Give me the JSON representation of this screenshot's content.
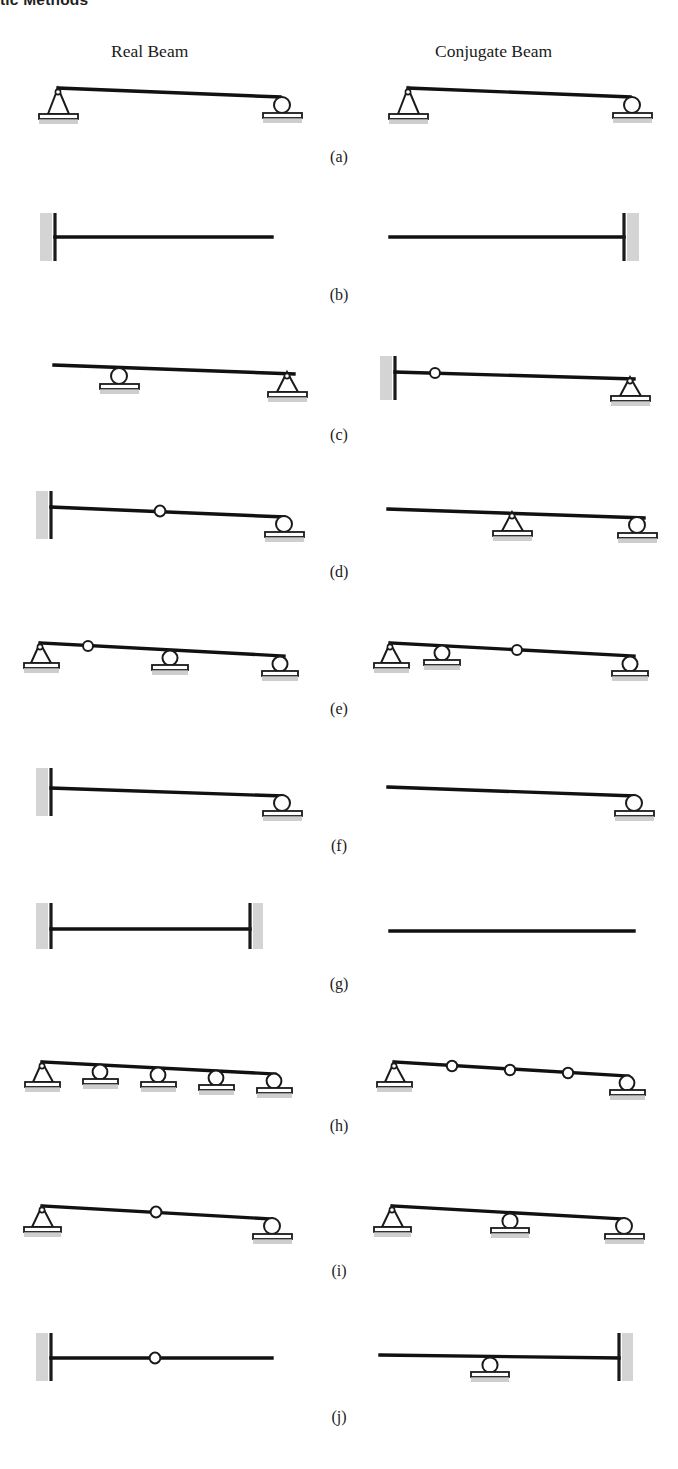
{
  "running_head": "tic Methods",
  "headings": {
    "real": "Real Beam",
    "conjugate": "Conjugate Beam"
  },
  "labels": {
    "a": "(a)",
    "b": "(b)",
    "c": "(c)",
    "d": "(d)",
    "e": "(e)",
    "f": "(f)",
    "g": "(g)",
    "h": "(h)",
    "i": "(i)",
    "j": "(j)"
  },
  "colors": {
    "beam": "#111111",
    "support_outline": "#1a1a1a",
    "hatch": "#9a9a9a",
    "text": "#1a1a1a",
    "page": "#ffffff"
  },
  "figure": {
    "type": "engineering-diagram",
    "columns": [
      "Real Beam",
      "Conjugate Beam"
    ],
    "rows": [
      {
        "label": "(a)",
        "real": {
          "description": "Simply supported beam: pin at left end, roller at right end",
          "supports": [
            {
              "type": "pin",
              "pos": "left-end"
            },
            {
              "type": "roller",
              "pos": "right-end"
            }
          ]
        },
        "conjugate": {
          "description": "Simply supported beam: pin at left end, roller at right end",
          "supports": [
            {
              "type": "pin",
              "pos": "left-end"
            },
            {
              "type": "roller",
              "pos": "right-end"
            }
          ]
        }
      },
      {
        "label": "(b)",
        "real": {
          "description": "Cantilever: fixed at left end, free at right end",
          "supports": [
            {
              "type": "fixed",
              "pos": "left-end"
            },
            {
              "type": "free",
              "pos": "right-end"
            }
          ]
        },
        "conjugate": {
          "description": "Cantilever reversed: free at left end, fixed at right end",
          "supports": [
            {
              "type": "free",
              "pos": "left-end"
            },
            {
              "type": "fixed",
              "pos": "right-end"
            }
          ]
        }
      },
      {
        "label": "(c)",
        "real": {
          "description": "Overhang: free left end, roller interior, pin at right end",
          "supports": [
            {
              "type": "free",
              "pos": "left-end"
            },
            {
              "type": "roller",
              "pos": "interior"
            },
            {
              "type": "pin",
              "pos": "right-end"
            }
          ]
        },
        "conjugate": {
          "description": "Fixed left end, internal hinge, pin at right end",
          "supports": [
            {
              "type": "fixed",
              "pos": "left-end"
            },
            {
              "type": "hinge",
              "pos": "interior"
            },
            {
              "type": "pin",
              "pos": "right-end"
            }
          ]
        }
      },
      {
        "label": "(d)",
        "real": {
          "description": "Fixed left end, internal hinge, roller at right end",
          "supports": [
            {
              "type": "fixed",
              "pos": "left-end"
            },
            {
              "type": "hinge",
              "pos": "interior"
            },
            {
              "type": "roller",
              "pos": "right-end"
            }
          ]
        },
        "conjugate": {
          "description": "Free left end, pin interior, roller at right end",
          "supports": [
            {
              "type": "free",
              "pos": "left-end"
            },
            {
              "type": "pin",
              "pos": "interior"
            },
            {
              "type": "roller",
              "pos": "right-end"
            }
          ]
        }
      },
      {
        "label": "(e)",
        "real": {
          "description": "Pin at left end, internal hinge, roller interior, roller at right end",
          "supports": [
            {
              "type": "pin",
              "pos": "left-end"
            },
            {
              "type": "hinge",
              "pos": "interior"
            },
            {
              "type": "roller",
              "pos": "interior"
            },
            {
              "type": "roller",
              "pos": "right-end"
            }
          ]
        },
        "conjugate": {
          "description": "Pin at left end, roller interior, internal hinge, roller at right end",
          "supports": [
            {
              "type": "pin",
              "pos": "left-end"
            },
            {
              "type": "roller",
              "pos": "interior"
            },
            {
              "type": "hinge",
              "pos": "interior"
            },
            {
              "type": "roller",
              "pos": "right-end"
            }
          ]
        }
      },
      {
        "label": "(f)",
        "real": {
          "description": "Propped cantilever: fixed at left end, roller at right end",
          "supports": [
            {
              "type": "fixed",
              "pos": "left-end"
            },
            {
              "type": "roller",
              "pos": "right-end"
            }
          ]
        },
        "conjugate": {
          "description": "Free at left end, roller at right end",
          "supports": [
            {
              "type": "free",
              "pos": "left-end"
            },
            {
              "type": "roller",
              "pos": "right-end"
            }
          ]
        }
      },
      {
        "label": "(g)",
        "real": {
          "description": "Fixed-fixed beam: fixed at both ends",
          "supports": [
            {
              "type": "fixed",
              "pos": "left-end"
            },
            {
              "type": "fixed",
              "pos": "right-end"
            }
          ]
        },
        "conjugate": {
          "description": "Unsupported floating beam: free at both ends",
          "supports": [
            {
              "type": "free",
              "pos": "left-end"
            },
            {
              "type": "free",
              "pos": "right-end"
            }
          ]
        }
      },
      {
        "label": "(h)",
        "real": {
          "description": "Continuous beam: pin at left end plus four rollers",
          "supports": [
            {
              "type": "pin",
              "pos": "left-end"
            },
            {
              "type": "roller",
              "pos": "interior"
            },
            {
              "type": "roller",
              "pos": "interior"
            },
            {
              "type": "roller",
              "pos": "interior"
            },
            {
              "type": "roller",
              "pos": "right-end"
            }
          ]
        },
        "conjugate": {
          "description": "Pin at left end, three internal hinges, roller at right end",
          "supports": [
            {
              "type": "pin",
              "pos": "left-end"
            },
            {
              "type": "hinge",
              "pos": "interior"
            },
            {
              "type": "hinge",
              "pos": "interior"
            },
            {
              "type": "hinge",
              "pos": "interior"
            },
            {
              "type": "roller",
              "pos": "right-end"
            }
          ]
        }
      },
      {
        "label": "(i)",
        "real": {
          "description": "Pin at left end, internal hinge, roller at right end",
          "supports": [
            {
              "type": "pin",
              "pos": "left-end"
            },
            {
              "type": "hinge",
              "pos": "interior"
            },
            {
              "type": "roller",
              "pos": "right-end"
            }
          ]
        },
        "conjugate": {
          "description": "Pin at left end, roller interior, roller at right end",
          "supports": [
            {
              "type": "pin",
              "pos": "left-end"
            },
            {
              "type": "roller",
              "pos": "interior"
            },
            {
              "type": "roller",
              "pos": "right-end"
            }
          ]
        }
      },
      {
        "label": "(j)",
        "real": {
          "description": "Fixed at left end, internal hinge, free right end",
          "supports": [
            {
              "type": "fixed",
              "pos": "left-end"
            },
            {
              "type": "hinge",
              "pos": "interior"
            },
            {
              "type": "free",
              "pos": "right-end"
            }
          ]
        },
        "conjugate": {
          "description": "Free left end, roller interior, fixed at right end",
          "supports": [
            {
              "type": "free",
              "pos": "left-end"
            },
            {
              "type": "roller",
              "pos": "interior"
            },
            {
              "type": "fixed",
              "pos": "right-end"
            }
          ]
        }
      }
    ]
  }
}
